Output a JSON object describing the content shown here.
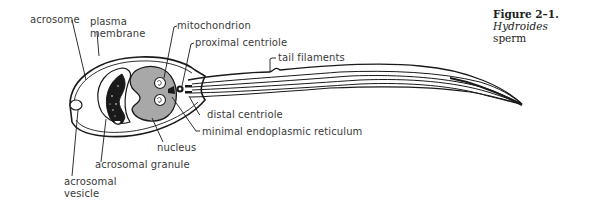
{
  "figure": {
    "caption": {
      "label": "Figure 2–1.",
      "species": "Hydroides",
      "subject": "sperm"
    },
    "labels": {
      "acrosome": "acrosome",
      "plasma_membrane_1": "plasma",
      "plasma_membrane_2": "membrane",
      "mitochondrion": "mitochondrion",
      "proximal_centriole": "proximal centriole",
      "tail_filaments": "tail filaments",
      "distal_centriole": "distal centriole",
      "minimal_er": "minimal endoplasmic reticulum",
      "nucleus": "nucleus",
      "acrosomal_granule": "acrosomal granule",
      "acrosomal_vesicle_1": "acrosomal",
      "acrosomal_vesicle_2": "vesicle"
    },
    "colors": {
      "line": "#1a1a1a",
      "nucleus_fill": "#a8a8a8",
      "granule_fill": "#1a1a1a"
    }
  }
}
